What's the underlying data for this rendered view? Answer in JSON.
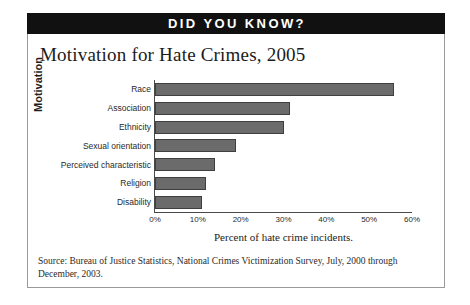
{
  "banner": {
    "label": "DID YOU KNOW?"
  },
  "chart_data": {
    "type": "bar",
    "orientation": "horizontal",
    "title": "Motivation for Hate Crimes, 2005",
    "xlabel": "Percent of hate crime incidents.",
    "ylabel": "Motivation",
    "categories": [
      "Race",
      "Association",
      "Ethnicity",
      "Sexual orientation",
      "Perceived characteristic",
      "Religion",
      "Disability"
    ],
    "values": [
      55.8,
      31.5,
      30.0,
      19.0,
      14.0,
      12.0,
      11.0
    ],
    "xlim": [
      0,
      60
    ],
    "xticks": [
      0,
      10,
      20,
      30,
      40,
      50,
      60
    ],
    "xtick_labels": [
      "0%",
      "10%",
      "20%",
      "30%",
      "40%",
      "50%",
      "60%"
    ],
    "grid": false,
    "legend": false,
    "bar_color": "#6b6b6b",
    "bar_edge_color": "#3f3f3f",
    "axis_color": "#4a4a4a"
  },
  "source": {
    "text": "Source: Bureau of Justice Statistics, National Crimes Victimization Survey, July, 2000 through December, 2003."
  }
}
